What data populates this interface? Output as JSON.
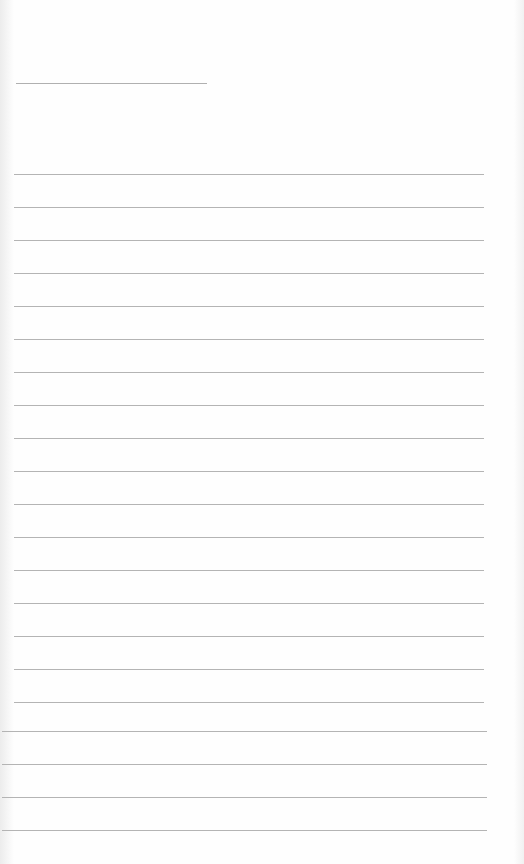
{
  "page": {
    "type": "ruled-notebook-page",
    "background_color": "#fefefe",
    "line_color": "#b4b4b4",
    "header_line": {
      "y": 83,
      "x_start": 16,
      "x_end": 207
    },
    "ruled_lines": {
      "count": 21,
      "x_start": 14,
      "x_end": 484,
      "y_positions": [
        174,
        207,
        240,
        273,
        306,
        339,
        372,
        405,
        438,
        471,
        504,
        537,
        570,
        603,
        636,
        669,
        702,
        731,
        764,
        797,
        830
      ]
    },
    "text": []
  }
}
